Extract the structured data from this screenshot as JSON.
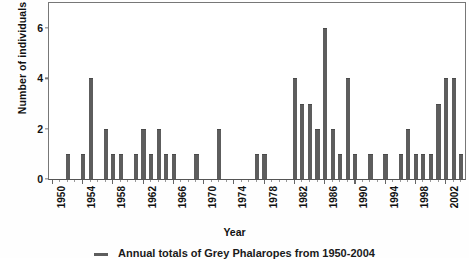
{
  "chart_data": {
    "type": "bar",
    "title": "",
    "caption": "Annual totals of Grey Phalaropes from 1950-2004",
    "xlabel": "Year",
    "ylabel": "Number of individuals",
    "ylim": [
      0,
      7
    ],
    "yticks": [
      0,
      2,
      4,
      6
    ],
    "xlim": [
      1949.5,
      2004.5
    ],
    "xticks": [
      1950,
      1954,
      1958,
      1962,
      1966,
      1970,
      1974,
      1978,
      1982,
      1986,
      1990,
      1994,
      1998,
      2002
    ],
    "grid": false,
    "legend": false,
    "bar_color": "#5d5d5d",
    "background_color": "#ffffff",
    "axis_color": "#777777",
    "categories": [
      1950,
      1951,
      1952,
      1953,
      1954,
      1955,
      1956,
      1957,
      1958,
      1959,
      1960,
      1961,
      1962,
      1963,
      1964,
      1965,
      1966,
      1967,
      1968,
      1969,
      1970,
      1971,
      1972,
      1973,
      1974,
      1975,
      1976,
      1977,
      1978,
      1979,
      1980,
      1981,
      1982,
      1983,
      1984,
      1985,
      1986,
      1987,
      1988,
      1989,
      1990,
      1991,
      1992,
      1993,
      1994,
      1995,
      1996,
      1997,
      1998,
      1999,
      2000,
      2001,
      2002,
      2003,
      2004
    ],
    "values": [
      0,
      0,
      1,
      0,
      1,
      4,
      0,
      2,
      1,
      1,
      0,
      1,
      2,
      1,
      2,
      1,
      1,
      0,
      0,
      1,
      0,
      0,
      2,
      0,
      0,
      0,
      0,
      1,
      1,
      0,
      0,
      0,
      4,
      3,
      3,
      2,
      6,
      2,
      1,
      4,
      1,
      0,
      1,
      0,
      1,
      0,
      1,
      2,
      1,
      1,
      1,
      3,
      4,
      4,
      1
    ]
  },
  "axis": {
    "y_title": "Number of individuals",
    "x_title": "Year",
    "y_tick_labels": [
      "0",
      "2",
      "4",
      "6"
    ],
    "x_tick_labels": [
      "1950",
      "1954",
      "1958",
      "1962",
      "1966",
      "1970",
      "1974",
      "1978",
      "1982",
      "1986",
      "1990",
      "1994",
      "1998",
      "2002"
    ]
  },
  "caption": {
    "text": "Annual totals of Grey Phalaropes from 1950-2004"
  }
}
